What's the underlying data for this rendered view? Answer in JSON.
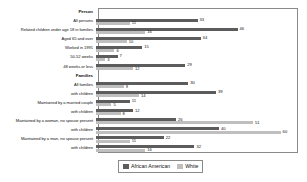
{
  "chart_data": {
    "type": "bar",
    "orientation": "horizontal",
    "title": "",
    "xlabel": "",
    "ylabel": "",
    "grid": false,
    "legend_position": "bottom",
    "xlim": [
      0,
      65
    ],
    "series": [
      {
        "name": "African American",
        "color": "#5c5c5c"
      },
      {
        "name": "White",
        "color": "#bfbfbf"
      }
    ],
    "rows": [
      {
        "label": "Person",
        "header": true
      },
      {
        "label": "All persons",
        "header": false,
        "african_american": 33,
        "white": 11
      },
      {
        "label": "Related children under age 18 in families",
        "header": false,
        "african_american": 46,
        "white": 16
      },
      {
        "label": "Aged 65 and over",
        "header": false,
        "african_american": 34,
        "white": 10
      },
      {
        "label": "Worked in 1991",
        "header": false,
        "african_american": 15,
        "white": 6
      },
      {
        "label": "50-52 weeks",
        "header": false,
        "african_american": 7,
        "white": 3
      },
      {
        "label": "48 weeks or less",
        "header": false,
        "african_american": 29,
        "white": 12
      },
      {
        "label": "Families",
        "header": true
      },
      {
        "label": "All families",
        "header": false,
        "african_american": 30,
        "white": 9
      },
      {
        "label": "with children",
        "header": false,
        "african_american": 39,
        "white": 14
      },
      {
        "label": "Maintained by a married couple",
        "header": false,
        "african_american": 11,
        "white": 5
      },
      {
        "label": "with children",
        "header": false,
        "african_american": 12,
        "white": 8
      },
      {
        "label": "Maintained by a woman, no spouse present",
        "header": false,
        "african_american": 26,
        "white": 51
      },
      {
        "label": "with children",
        "header": false,
        "african_american": 40,
        "white": 60
      },
      {
        "label": "Maintained by a man, no spouse present",
        "header": false,
        "african_american": 22,
        "white": 11
      },
      {
        "label": "with children",
        "header": false,
        "african_american": 32,
        "white": 16
      }
    ]
  },
  "legend": {
    "items": [
      {
        "label": "African American",
        "swatch": "aa"
      },
      {
        "label": "White",
        "swatch": "wh"
      }
    ]
  }
}
